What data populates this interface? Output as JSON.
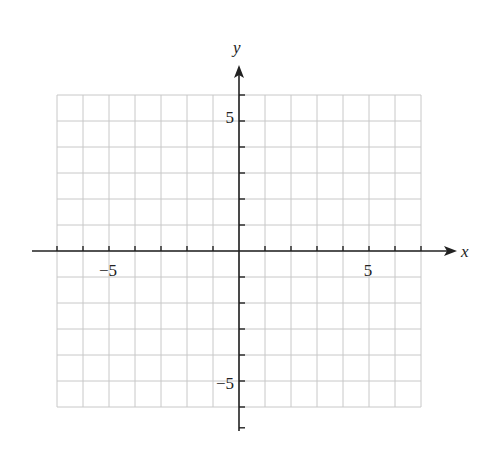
{
  "chart_data": {
    "type": "scatter",
    "title": "",
    "xlabel": "x",
    "ylabel": "y",
    "xlim": [
      -7,
      7
    ],
    "ylim": [
      -6,
      6
    ],
    "grid": true,
    "grid_step": 1,
    "x_tick_labels": [
      {
        "value": -5,
        "label": "−5"
      },
      {
        "value": 5,
        "label": "5"
      }
    ],
    "y_tick_labels": [
      {
        "value": 5,
        "label": "5"
      },
      {
        "value": -5,
        "label": "−5"
      }
    ],
    "series": []
  },
  "colors": {
    "grid": "#c8c8c8",
    "axis": "#222222",
    "background": "#ffffff"
  },
  "labels": {
    "x_axis": "x",
    "y_axis": "y",
    "x_neg5": "−5",
    "x_pos5": "5",
    "y_pos5": "5",
    "y_neg5": "−5"
  }
}
